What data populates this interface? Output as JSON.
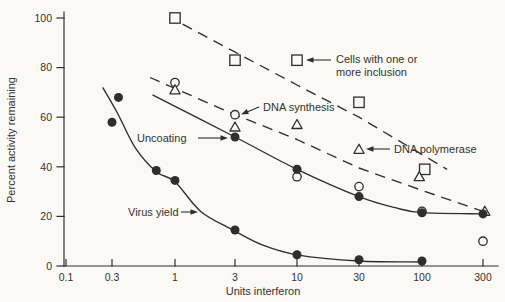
{
  "figure": {
    "paper_color": "#faf9f6",
    "ink_color": "#2f2e2c",
    "text_color": "#35332f"
  },
  "chart_data": {
    "type": "scatter",
    "title": "",
    "xlabel": "Units interferon",
    "ylabel": "Percent activity remaining",
    "x_scale": "log",
    "x_ticks": [
      0.1,
      0.3,
      1,
      3,
      10,
      30,
      100,
      300
    ],
    "x_tick_labels": [
      "0.1",
      "0.3",
      "1",
      "3",
      "10",
      "30",
      "100",
      "300"
    ],
    "y_ticks": [
      0,
      20,
      40,
      60,
      80,
      100
    ],
    "y_tick_labels": [
      "0",
      "20",
      "40",
      "60",
      "80",
      "100"
    ],
    "ylim": [
      0,
      100
    ],
    "xlim": [
      0.1,
      400
    ],
    "grid": false,
    "legend_position": "inline-annotations",
    "series": [
      {
        "id": "cells-with-inclusion",
        "name": "Cells with one or more inclusion",
        "marker": "open-square",
        "line_style": "dashed",
        "points": [
          [
            1,
            100
          ],
          [
            3,
            83
          ],
          [
            10,
            83
          ],
          [
            30,
            66
          ],
          [
            105,
            39
          ]
        ],
        "trend": [
          [
            1.15,
            97.5
          ],
          [
            10,
            73
          ],
          [
            30,
            60
          ],
          [
            157,
            39
          ]
        ]
      },
      {
        "id": "dna-synthesis",
        "name": "DNA synthesis",
        "marker": "open-circle",
        "line_style": "none",
        "points": [
          [
            1,
            74
          ],
          [
            3,
            61
          ],
          [
            10,
            36
          ],
          [
            30,
            32
          ],
          [
            100,
            22
          ],
          [
            300,
            10
          ]
        ]
      },
      {
        "id": "dna-polymerase",
        "name": "DNA polymerase",
        "marker": "open-triangle",
        "line_style": "dashed",
        "points": [
          [
            1,
            71
          ],
          [
            3,
            56
          ],
          [
            10,
            57
          ],
          [
            30,
            47
          ],
          [
            95,
            36
          ],
          [
            310,
            22
          ]
        ],
        "trend": [
          [
            0.62,
            76
          ],
          [
            3,
            61
          ],
          [
            10,
            51
          ],
          [
            30,
            39.5
          ],
          [
            100,
            30.5
          ],
          [
            300,
            22
          ]
        ]
      },
      {
        "id": "uncoating",
        "name": "Uncoating",
        "marker": "filled-circle",
        "line_style": "solid",
        "smooth": true,
        "points": [
          [
            3,
            52
          ],
          [
            10,
            39
          ],
          [
            30,
            28
          ],
          [
            100,
            21.5
          ],
          [
            300,
            21
          ]
        ],
        "trend": [
          [
            0.65,
            69
          ],
          [
            3,
            52
          ],
          [
            10,
            39
          ],
          [
            30,
            28
          ],
          [
            60,
            23.5
          ],
          [
            100,
            21.5
          ],
          [
            300,
            21
          ]
        ]
      },
      {
        "id": "virus-yield",
        "name": "Virus yield",
        "marker": "filled-circle",
        "line_style": "solid",
        "smooth": true,
        "points": [
          [
            0.3,
            58
          ],
          [
            0.34,
            68
          ],
          [
            0.7,
            38.5
          ],
          [
            1,
            34.5
          ],
          [
            3,
            14.5
          ],
          [
            10,
            4.5
          ],
          [
            30,
            2.5
          ],
          [
            100,
            2
          ]
        ],
        "trend": [
          [
            0.24,
            72
          ],
          [
            0.33,
            62
          ],
          [
            0.47,
            47.5
          ],
          [
            0.7,
            38
          ],
          [
            1,
            34
          ],
          [
            1.6,
            22
          ],
          [
            2.9,
            14.5
          ],
          [
            5.1,
            8.5
          ],
          [
            10,
            4.5
          ],
          [
            30,
            2
          ],
          [
            100,
            1.6
          ]
        ]
      }
    ],
    "annotations": [
      {
        "id": "cells-with-inclusion",
        "lines": [
          "Cells with one or",
          "more inclusion"
        ],
        "x": 336,
        "y": 63,
        "arrow": {
          "x1": 331,
          "y1": 60,
          "x2": 313,
          "y2": 60,
          "tx": 306,
          "ty": 60,
          "angle": 180
        }
      },
      {
        "id": "dna-synthesis",
        "lines": [
          "DNA synthesis"
        ],
        "x": 263,
        "y": 111,
        "arrow": {
          "x1": 259,
          "y1": 107,
          "x2": 247,
          "y2": 112,
          "tx": 241,
          "ty": 114.5,
          "angle": 156
        }
      },
      {
        "id": "uncoating",
        "lines": [
          "Uncoating"
        ],
        "x": 137,
        "y": 142,
        "arrow": {
          "x1": 198,
          "y1": 138,
          "x2": 221,
          "y2": 138,
          "tx": 228,
          "ty": 138,
          "angle": 0
        }
      },
      {
        "id": "dna-polymerase",
        "lines": [
          "DNA polymerase"
        ],
        "x": 394,
        "y": 153,
        "arrow": {
          "x1": 390,
          "y1": 149,
          "x2": 372,
          "y2": 149,
          "tx": 366,
          "ty": 149,
          "angle": 180
        }
      },
      {
        "id": "virus-yield",
        "lines": [
          "Virus yield"
        ],
        "x": 128,
        "y": 216,
        "arrow": {
          "x1": 181,
          "y1": 212,
          "x2": 191,
          "y2": 212,
          "tx": 198,
          "ty": 212,
          "angle": 0
        }
      }
    ]
  }
}
